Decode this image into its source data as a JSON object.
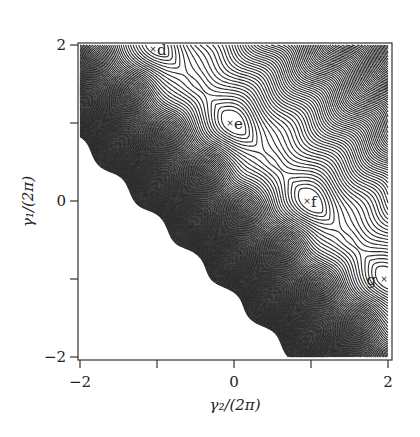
{
  "chart_data": {
    "type": "contour",
    "title": "",
    "xlabel": "γ₂/(2π)",
    "ylabel": "γ₁/(2π)",
    "xlim": [
      -2,
      2
    ],
    "ylim": [
      -2,
      2
    ],
    "x_ticks": [
      -2,
      -1,
      0,
      1,
      2
    ],
    "y_ticks": [
      -2,
      -1,
      0,
      1,
      2
    ],
    "x_tick_labels": [
      {
        "value": -2,
        "label": "−2"
      },
      {
        "value": 0,
        "label": "0"
      },
      {
        "value": 2,
        "label": "2"
      }
    ],
    "y_tick_labels": [
      {
        "value": -2,
        "label": "−2"
      },
      {
        "value": 0,
        "label": "0"
      },
      {
        "value": 2,
        "label": "2"
      }
    ],
    "grid": false,
    "legend": "none",
    "valley_line": {
      "slope": -1,
      "intercept": 1
    },
    "minima": [
      {
        "label": "d",
        "gamma2": -1,
        "gamma1": 2
      },
      {
        "label": "e",
        "gamma2": 0,
        "gamma1": 1
      },
      {
        "label": "f",
        "gamma2": 1,
        "gamma1": 0
      },
      {
        "label": "g",
        "gamma2": 2,
        "gamma1": -1
      }
    ],
    "secondary_minima": [
      {
        "gamma2": -0.5,
        "gamma1": 1.5
      },
      {
        "gamma2": 0.5,
        "gamma1": 0.5
      },
      {
        "gamma2": 1.5,
        "gamma1": -0.5
      }
    ],
    "marker_symbol": "×"
  }
}
